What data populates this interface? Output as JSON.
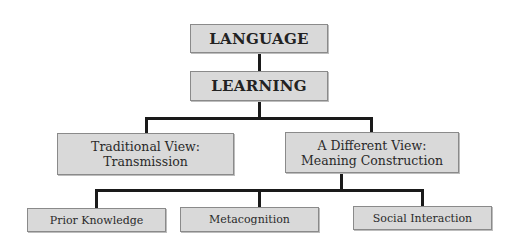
{
  "diagram": {
    "type": "hierarchy",
    "root": {
      "label": "LANGUAGE"
    },
    "level1": {
      "label": "LEARNING"
    },
    "level2": [
      {
        "line1": "Traditional View:",
        "line2": "Transmission"
      },
      {
        "line1": "A Different View:",
        "line2": "Meaning Construction"
      }
    ],
    "level3": [
      {
        "label": "Prior Knowledge"
      },
      {
        "label": "Metacognition"
      },
      {
        "label": "Social Interaction"
      }
    ],
    "colors": {
      "box_fill": "#d9d9d9",
      "box_border": "#8a8a8a",
      "connector": "#1a1a1a"
    }
  }
}
